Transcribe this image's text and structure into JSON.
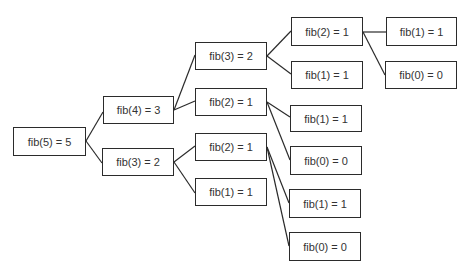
{
  "diagram": {
    "colors": {
      "stroke": "#2b2b2b",
      "text": "#333333",
      "background": "#ffffff"
    },
    "nodes": [
      {
        "id": "n0",
        "label": "fib(5) = 5",
        "x": 13,
        "y": 127,
        "w": 73,
        "h": 29
      },
      {
        "id": "n1",
        "label": "fib(4) = 3",
        "x": 103,
        "y": 96,
        "w": 71,
        "h": 28
      },
      {
        "id": "n2",
        "label": "fib(3) = 2",
        "x": 102,
        "y": 148,
        "w": 72,
        "h": 28
      },
      {
        "id": "n3",
        "label": "fib(3) = 2",
        "x": 195,
        "y": 42,
        "w": 72,
        "h": 28
      },
      {
        "id": "n4",
        "label": "fib(2) = 1",
        "x": 195,
        "y": 88,
        "w": 72,
        "h": 28
      },
      {
        "id": "n5",
        "label": "fib(2) = 1",
        "x": 195,
        "y": 133,
        "w": 72,
        "h": 28
      },
      {
        "id": "n6",
        "label": "fib(1) = 1",
        "x": 195,
        "y": 178,
        "w": 72,
        "h": 28
      },
      {
        "id": "n7",
        "label": "fib(2) = 1",
        "x": 291,
        "y": 17,
        "w": 72,
        "h": 29
      },
      {
        "id": "n8",
        "label": "fib(1) = 1",
        "x": 291,
        "y": 61,
        "w": 72,
        "h": 28
      },
      {
        "id": "n9",
        "label": "fib(1) = 1",
        "x": 290,
        "y": 105,
        "w": 72,
        "h": 27
      },
      {
        "id": "n10",
        "label": "fib(0) = 0",
        "x": 290,
        "y": 146,
        "w": 72,
        "h": 29
      },
      {
        "id": "n11",
        "label": "fib(1) = 1",
        "x": 289,
        "y": 189,
        "w": 72,
        "h": 29
      },
      {
        "id": "n12",
        "label": "fib(0) = 0",
        "x": 289,
        "y": 232,
        "w": 72,
        "h": 29
      },
      {
        "id": "n13",
        "label": "fib(1) = 1",
        "x": 386,
        "y": 17,
        "w": 71,
        "h": 29
      },
      {
        "id": "n14",
        "label": "fib(0) = 0",
        "x": 385,
        "y": 61,
        "w": 72,
        "h": 28
      }
    ],
    "edges": [
      {
        "from": "n0",
        "to": "n1",
        "x1": 86,
        "y1": 141,
        "x2": 103,
        "y2": 112
      },
      {
        "from": "n0",
        "to": "n2",
        "x1": 86,
        "y1": 141,
        "x2": 102,
        "y2": 163
      },
      {
        "from": "n1",
        "to": "n3",
        "x1": 174,
        "y1": 110,
        "x2": 195,
        "y2": 55
      },
      {
        "from": "n1",
        "to": "n4",
        "x1": 174,
        "y1": 110,
        "x2": 195,
        "y2": 101
      },
      {
        "from": "n2",
        "to": "n5",
        "x1": 174,
        "y1": 162,
        "x2": 195,
        "y2": 146
      },
      {
        "from": "n2",
        "to": "n6",
        "x1": 174,
        "y1": 162,
        "x2": 195,
        "y2": 193
      },
      {
        "from": "n3",
        "to": "n7",
        "x1": 267,
        "y1": 56,
        "x2": 291,
        "y2": 31
      },
      {
        "from": "n3",
        "to": "n8",
        "x1": 267,
        "y1": 56,
        "x2": 291,
        "y2": 74
      },
      {
        "from": "n4",
        "to": "n9",
        "x1": 267,
        "y1": 102,
        "x2": 290,
        "y2": 117
      },
      {
        "from": "n4",
        "to": "n10",
        "x1": 267,
        "y1": 102,
        "x2": 290,
        "y2": 160
      },
      {
        "from": "n5",
        "to": "n11",
        "x1": 267,
        "y1": 147,
        "x2": 289,
        "y2": 203
      },
      {
        "from": "n5",
        "to": "n12",
        "x1": 267,
        "y1": 147,
        "x2": 289,
        "y2": 246
      },
      {
        "from": "n7",
        "to": "n13",
        "x1": 363,
        "y1": 32,
        "x2": 386,
        "y2": 32
      },
      {
        "from": "n7",
        "to": "n14",
        "x1": 363,
        "y1": 32,
        "x2": 385,
        "y2": 75
      }
    ]
  }
}
